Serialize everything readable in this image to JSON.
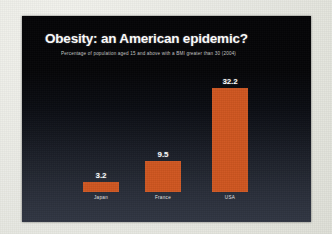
{
  "slide": {
    "title": "Obesity: an American epidemic?",
    "subtitle": "Percentage of population aged 15 and above with a BMI greater than 30 (2004)",
    "background_top_color": "#040406",
    "background_bottom_color": "#313643",
    "frame_color": "#e7e8e1",
    "bar_color": "#cf5620",
    "text_color": "#ffffff"
  },
  "chart_data": {
    "type": "bar",
    "title": "Obesity: an American epidemic?",
    "subtitle": "Percentage of population aged 15 and above with a BMI greater than 30 (2004)",
    "categories": [
      "Japan",
      "France",
      "USA"
    ],
    "values": [
      3.2,
      9.5,
      32.2
    ],
    "value_labels": [
      "3.2",
      "9.5",
      "32.2"
    ],
    "xlabel": "",
    "ylabel": "",
    "ylim": [
      0,
      35
    ],
    "grid": false,
    "legend": false,
    "series_color": "#cf5620"
  }
}
